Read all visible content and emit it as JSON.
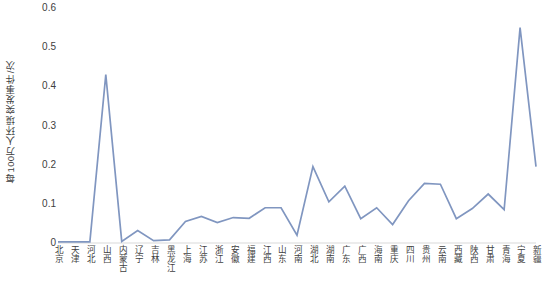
{
  "chart_data": {
    "type": "line",
    "title": "",
    "xlabel": "",
    "ylabel": "每100万人环境突发事件/次",
    "ylim": [
      0,
      0.6
    ],
    "yticks": [
      "0",
      "0.1",
      "0.2",
      "0.3",
      "0.4",
      "0.5",
      "0.6"
    ],
    "ytick_values": [
      0,
      0.1,
      0.2,
      0.3,
      0.4,
      0.5,
      0.6
    ],
    "grid": false,
    "legend": "none",
    "series_color": "#8096C0",
    "categories": [
      "北京",
      "天津",
      "河北",
      "山西",
      "内蒙古",
      "辽宁",
      "吉林",
      "黑龙江",
      "上海",
      "江苏",
      "浙江",
      "安徽",
      "福建",
      "江西",
      "山东",
      "河南",
      "湖北",
      "湖南",
      "广东",
      "广西",
      "海南",
      "重庆",
      "四川",
      "贵州",
      "云南",
      "西藏",
      "陕西",
      "甘肃",
      "青海",
      "宁夏",
      "新疆"
    ],
    "series": [
      {
        "name": "每100万人环境突发事件/次",
        "values": [
          0.003,
          0.003,
          0.003,
          0.43,
          0.004,
          0.032,
          0.006,
          0.008,
          0.055,
          0.068,
          0.052,
          0.065,
          0.063,
          0.09,
          0.09,
          0.02,
          0.195,
          0.105,
          0.145,
          0.062,
          0.09,
          0.047,
          0.108,
          0.152,
          0.15,
          0.062,
          0.088,
          0.125,
          0.085,
          0.55,
          0.195
        ]
      }
    ]
  }
}
